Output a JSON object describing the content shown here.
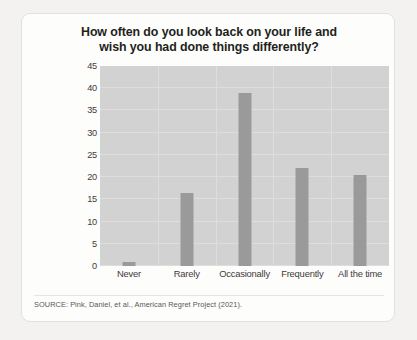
{
  "figure": {
    "title": "How often do you look back on your life and wish you had done things differently?",
    "title_line1": "How often do you look back on your life and",
    "title_line2": "wish you had done things differently?",
    "source_note": "SOURCE: Pink, Daniel, et al., American Regret Project (2021).",
    "colors": {
      "page_background": "#f3f2f0",
      "card_background": "#fdfdfc",
      "card_border": "#e2e1df",
      "plot_background": "#d2d2d2",
      "gridline": "#dedede",
      "bar": "#9a9a9a",
      "text": "#231f20",
      "axis_text": "#3d3b39",
      "source_text": "#5b5856"
    }
  },
  "chart_data": {
    "type": "bar",
    "title": "How often do you look back on your life and wish you had done things differently?",
    "xlabel": "",
    "ylabel": "Percentage of respondents",
    "categories": [
      "Never",
      "Rarely",
      "Occasionally",
      "Frequently",
      "All the time"
    ],
    "values": [
      1,
      16.5,
      39,
      22,
      20.5
    ],
    "ylim": [
      0,
      45
    ],
    "yticks": [
      0,
      5,
      10,
      15,
      20,
      25,
      30,
      35,
      40,
      45
    ],
    "ytick_labels": [
      "0",
      "5",
      "10",
      "15",
      "20",
      "25",
      "30",
      "35",
      "40",
      "45"
    ],
    "grid": true,
    "grid_axis": "both",
    "legend": false,
    "legend_position": "none",
    "bar_color": "#9a9a9a",
    "source": "SOURCE: Pink, Daniel, et al., American Regret Project (2021)."
  }
}
